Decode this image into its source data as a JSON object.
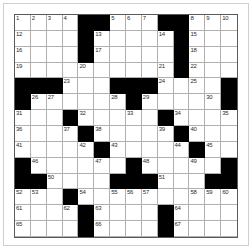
{
  "puzzle": {
    "title": "Crossword Grid",
    "columns": 14,
    "rows": 14,
    "colors": {
      "block": "#000000",
      "cell": "#ffffff",
      "gridline": "#b0b0b0",
      "border": "#5a5a5a",
      "number_text": "#2b2b2b"
    },
    "highest_clue_number": 70,
    "grid": [
      [
        {
          "type": "white",
          "number": "1"
        },
        {
          "type": "white",
          "number": "2"
        },
        {
          "type": "white",
          "number": "3"
        },
        {
          "type": "white",
          "number": "4"
        },
        {
          "type": "block"
        },
        {
          "type": "block"
        },
        {
          "type": "white",
          "number": "5"
        },
        {
          "type": "white",
          "number": "6"
        },
        {
          "type": "white",
          "number": "7"
        },
        {
          "type": "block"
        },
        {
          "type": "block"
        },
        {
          "type": "white",
          "number": "8"
        },
        {
          "type": "white",
          "number": "9"
        },
        {
          "type": "white",
          "number": "10"
        }
      ],
      [
        {
          "type": "white",
          "number": "12"
        },
        {
          "type": "white"
        },
        {
          "type": "white"
        },
        {
          "type": "white"
        },
        {
          "type": "block"
        },
        {
          "type": "white",
          "number": "13"
        },
        {
          "type": "white"
        },
        {
          "type": "white"
        },
        {
          "type": "white"
        },
        {
          "type": "white",
          "number": "14"
        },
        {
          "type": "block"
        },
        {
          "type": "white",
          "number": "15"
        },
        {
          "type": "white"
        },
        {
          "type": "white"
        }
      ],
      [
        {
          "type": "white",
          "number": "16"
        },
        {
          "type": "white"
        },
        {
          "type": "white"
        },
        {
          "type": "white"
        },
        {
          "type": "block"
        },
        {
          "type": "white",
          "number": "17"
        },
        {
          "type": "white"
        },
        {
          "type": "white"
        },
        {
          "type": "white"
        },
        {
          "type": "white"
        },
        {
          "type": "block"
        },
        {
          "type": "white",
          "number": "18"
        },
        {
          "type": "white"
        },
        {
          "type": "white"
        }
      ],
      [
        {
          "type": "white",
          "number": "19"
        },
        {
          "type": "white"
        },
        {
          "type": "white"
        },
        {
          "type": "white"
        },
        {
          "type": "white",
          "number": "20"
        },
        {
          "type": "white"
        },
        {
          "type": "white"
        },
        {
          "type": "white"
        },
        {
          "type": "white"
        },
        {
          "type": "white",
          "number": "21"
        },
        {
          "type": "block"
        },
        {
          "type": "white",
          "number": "22"
        },
        {
          "type": "white"
        },
        {
          "type": "white"
        }
      ],
      [
        {
          "type": "block"
        },
        {
          "type": "block"
        },
        {
          "type": "block"
        },
        {
          "type": "white",
          "number": "23"
        },
        {
          "type": "white"
        },
        {
          "type": "white"
        },
        {
          "type": "block"
        },
        {
          "type": "block"
        },
        {
          "type": "block"
        },
        {
          "type": "white",
          "number": "24"
        },
        {
          "type": "white"
        },
        {
          "type": "white",
          "number": "25"
        },
        {
          "type": "white"
        },
        {
          "type": "block"
        }
      ],
      [
        {
          "type": "block"
        },
        {
          "type": "white",
          "number": "26"
        },
        {
          "type": "white",
          "number": "27"
        },
        {
          "type": "white"
        },
        {
          "type": "white"
        },
        {
          "type": "white"
        },
        {
          "type": "white",
          "number": "28"
        },
        {
          "type": "block"
        },
        {
          "type": "white",
          "number": "29"
        },
        {
          "type": "white"
        },
        {
          "type": "white"
        },
        {
          "type": "white"
        },
        {
          "type": "white",
          "number": "30"
        },
        {
          "type": "block"
        }
      ],
      [
        {
          "type": "white",
          "number": "31"
        },
        {
          "type": "white"
        },
        {
          "type": "white"
        },
        {
          "type": "block"
        },
        {
          "type": "white",
          "number": "32"
        },
        {
          "type": "white"
        },
        {
          "type": "white"
        },
        {
          "type": "white",
          "number": "33"
        },
        {
          "type": "white"
        },
        {
          "type": "block"
        },
        {
          "type": "white",
          "number": "34"
        },
        {
          "type": "white"
        },
        {
          "type": "white"
        },
        {
          "type": "white",
          "number": "35"
        }
      ],
      [
        {
          "type": "white",
          "number": "36"
        },
        {
          "type": "white"
        },
        {
          "type": "white"
        },
        {
          "type": "white",
          "number": "37"
        },
        {
          "type": "block"
        },
        {
          "type": "white",
          "number": "38"
        },
        {
          "type": "white"
        },
        {
          "type": "white"
        },
        {
          "type": "white"
        },
        {
          "type": "white",
          "number": "39"
        },
        {
          "type": "block"
        },
        {
          "type": "white",
          "number": "40"
        },
        {
          "type": "white"
        },
        {
          "type": "white"
        }
      ],
      [
        {
          "type": "white",
          "number": "41"
        },
        {
          "type": "white"
        },
        {
          "type": "white"
        },
        {
          "type": "white"
        },
        {
          "type": "white",
          "number": "42"
        },
        {
          "type": "block"
        },
        {
          "type": "white",
          "number": "43"
        },
        {
          "type": "white"
        },
        {
          "type": "white"
        },
        {
          "type": "white"
        },
        {
          "type": "white",
          "number": "44"
        },
        {
          "type": "block"
        },
        {
          "type": "white",
          "number": "45"
        },
        {
          "type": "white"
        }
      ],
      [
        {
          "type": "block"
        },
        {
          "type": "white",
          "number": "46"
        },
        {
          "type": "white"
        },
        {
          "type": "white"
        },
        {
          "type": "white"
        },
        {
          "type": "white",
          "number": "47"
        },
        {
          "type": "white"
        },
        {
          "type": "block"
        },
        {
          "type": "white",
          "number": "48"
        },
        {
          "type": "white"
        },
        {
          "type": "white"
        },
        {
          "type": "white",
          "number": "49"
        },
        {
          "type": "white"
        },
        {
          "type": "block"
        }
      ],
      [
        {
          "type": "block"
        },
        {
          "type": "block"
        },
        {
          "type": "white",
          "number": "50"
        },
        {
          "type": "white"
        },
        {
          "type": "white"
        },
        {
          "type": "white"
        },
        {
          "type": "block"
        },
        {
          "type": "block"
        },
        {
          "type": "block"
        },
        {
          "type": "white",
          "number": "51"
        },
        {
          "type": "white"
        },
        {
          "type": "white"
        },
        {
          "type": "block"
        },
        {
          "type": "block"
        }
      ],
      [
        {
          "type": "white",
          "number": "52"
        },
        {
          "type": "white",
          "number": "53"
        },
        {
          "type": "white"
        },
        {
          "type": "block"
        },
        {
          "type": "white",
          "number": "54"
        },
        {
          "type": "white"
        },
        {
          "type": "white",
          "number": "55"
        },
        {
          "type": "white",
          "number": "56"
        },
        {
          "type": "white",
          "number": "57"
        },
        {
          "type": "white"
        },
        {
          "type": "white"
        },
        {
          "type": "white",
          "number": "58"
        },
        {
          "type": "white",
          "number": "59"
        },
        {
          "type": "white",
          "number": "60"
        }
      ],
      [
        {
          "type": "white",
          "number": "61"
        },
        {
          "type": "white"
        },
        {
          "type": "white"
        },
        {
          "type": "white",
          "number": "62"
        },
        {
          "type": "block"
        },
        {
          "type": "white",
          "number": "63"
        },
        {
          "type": "white"
        },
        {
          "type": "white"
        },
        {
          "type": "white"
        },
        {
          "type": "block"
        },
        {
          "type": "white",
          "number": "64"
        },
        {
          "type": "white"
        },
        {
          "type": "white"
        },
        {
          "type": "white"
        }
      ],
      [
        {
          "type": "white",
          "number": "65"
        },
        {
          "type": "white"
        },
        {
          "type": "white"
        },
        {
          "type": "white"
        },
        {
          "type": "block"
        },
        {
          "type": "white",
          "number": "66"
        },
        {
          "type": "white"
        },
        {
          "type": "white"
        },
        {
          "type": "white"
        },
        {
          "type": "block"
        },
        {
          "type": "white",
          "number": "67"
        },
        {
          "type": "white"
        },
        {
          "type": "white"
        },
        {
          "type": "white"
        }
      ],
      [
        {
          "type": "white",
          "number": "68"
        },
        {
          "type": "white"
        },
        {
          "type": "white"
        },
        {
          "type": "white"
        },
        {
          "type": "block"
        },
        {
          "type": "white",
          "number": "69"
        },
        {
          "type": "white"
        },
        {
          "type": "white"
        },
        {
          "type": "block"
        },
        {
          "type": "block"
        },
        {
          "type": "white",
          "number": "70"
        },
        {
          "type": "white"
        },
        {
          "type": "white"
        },
        {
          "type": "white"
        }
      ]
    ]
  }
}
